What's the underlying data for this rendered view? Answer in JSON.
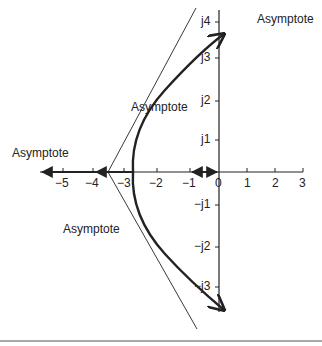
{
  "diagram": {
    "type": "root-locus",
    "axes": {
      "real_ticks": [
        "−5",
        "−4",
        "−3",
        "−2",
        "−1",
        "0",
        "1",
        "2",
        "3"
      ],
      "imag_ticks_pos": [
        "j1",
        "j2",
        "j3",
        "j4"
      ],
      "imag_ticks_neg": [
        "−j1",
        "−j2",
        "−j3"
      ]
    },
    "labels": {
      "asymptote_top_right": "Asymptote",
      "asymptote_middle": "Asymptote",
      "asymptote_left": "Asymptote",
      "asymptote_bottom_left": "Asymptote"
    },
    "colors": {
      "line": "#222222",
      "background": "#ffffff"
    }
  }
}
